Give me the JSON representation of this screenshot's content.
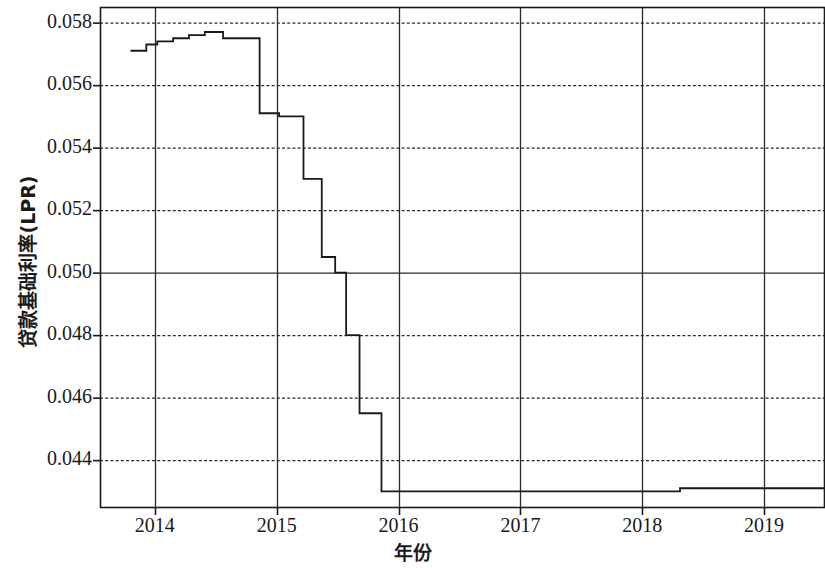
{
  "chart_data": {
    "type": "line",
    "title": "",
    "xlabel": "年份",
    "ylabel": "贷款基础利率(LPR)",
    "xlim": [
      2013.55,
      2019.5
    ],
    "ylim": [
      0.0425,
      0.0585
    ],
    "grid": true,
    "legend": "none",
    "line_style": "step-post",
    "line_color": "#1a1a1a",
    "x_ticks": [
      "2014",
      "2015",
      "2016",
      "2017",
      "2018",
      "2019"
    ],
    "x_tick_values": [
      2014,
      2015,
      2016,
      2017,
      2018,
      2019
    ],
    "y_ticks": [
      "0.044",
      "0.046",
      "0.048",
      "0.050",
      "0.052",
      "0.054",
      "0.056",
      "0.058"
    ],
    "y_tick_values": [
      0.044,
      0.046,
      0.048,
      0.05,
      0.052,
      0.054,
      0.056,
      0.058
    ],
    "series": [
      {
        "name": "贷款基础利率(LPR)",
        "x": [
          2013.8,
          2013.93,
          2014.02,
          2014.15,
          2014.28,
          2014.41,
          2014.56,
          2014.86,
          2015.02,
          2015.22,
          2015.37,
          2015.48,
          2015.57,
          2015.68,
          2015.86,
          2018.31,
          2019.42
        ],
        "values": [
          0.0571,
          0.0573,
          0.0574,
          0.0575,
          0.0576,
          0.0577,
          0.0575,
          0.0551,
          0.055,
          0.053,
          0.0505,
          0.05,
          0.048,
          0.0455,
          0.043,
          0.0431,
          0.0431
        ]
      }
    ]
  },
  "axes": {
    "plot_left_px": 100,
    "plot_right_px": 825,
    "plot_top_px": 7,
    "plot_bottom_px": 507
  }
}
